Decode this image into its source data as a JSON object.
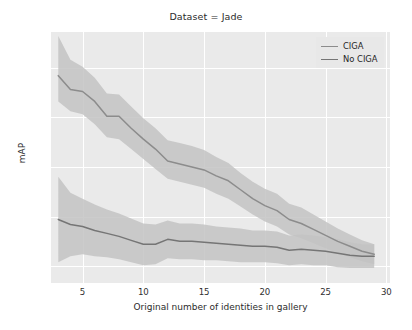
{
  "chart_data": {
    "type": "line",
    "title": "Dataset = Jade",
    "xlabel": "Original number of identities in gallery",
    "ylabel": "mAP",
    "xlim": [
      2.4,
      30.3
    ],
    "ylim": [
      0.383,
      0.636
    ],
    "xticks": [
      5,
      10,
      15,
      20,
      25,
      30
    ],
    "yticks": [
      0.4,
      0.45,
      0.5,
      0.55,
      0.6
    ],
    "ytick_labels": [
      "0.40",
      "0.45",
      "0.50",
      "0.55",
      "0.60"
    ],
    "xtick_labels": [
      "5",
      "10",
      "15",
      "20",
      "25",
      "30"
    ],
    "grid": true,
    "legend_position": "upper right",
    "band_type": "confidence interval",
    "x": [
      3,
      4,
      5,
      6,
      7,
      8,
      9,
      10,
      11,
      12,
      13,
      14,
      15,
      16,
      17,
      18,
      19,
      20,
      21,
      22,
      23,
      24,
      25,
      26,
      27,
      28,
      29
    ],
    "series": [
      {
        "name": "CIGA",
        "color": "#8c8c8c",
        "values": [
          0.592,
          0.578,
          0.576,
          0.566,
          0.551,
          0.551,
          0.539,
          0.528,
          0.518,
          0.506,
          0.503,
          0.5,
          0.497,
          0.491,
          0.486,
          0.477,
          0.468,
          0.461,
          0.456,
          0.447,
          0.443,
          0.437,
          0.431,
          0.425,
          0.42,
          0.415,
          0.412
        ],
        "band_lower": [
          0.566,
          0.556,
          0.553,
          0.543,
          0.53,
          0.528,
          0.518,
          0.508,
          0.498,
          0.488,
          0.485,
          0.482,
          0.479,
          0.473,
          0.468,
          0.46,
          0.452,
          0.445,
          0.44,
          0.432,
          0.428,
          0.423,
          0.418,
          0.413,
          0.409,
          0.405,
          0.402
        ],
        "band_upper": [
          0.632,
          0.608,
          0.601,
          0.59,
          0.574,
          0.573,
          0.561,
          0.549,
          0.539,
          0.527,
          0.524,
          0.521,
          0.517,
          0.51,
          0.504,
          0.494,
          0.485,
          0.478,
          0.473,
          0.463,
          0.459,
          0.452,
          0.445,
          0.438,
          0.432,
          0.426,
          0.422
        ]
      },
      {
        "name": "No CIGA",
        "color": "#757575",
        "values": [
          0.447,
          0.442,
          0.44,
          0.436,
          0.433,
          0.43,
          0.426,
          0.422,
          0.422,
          0.427,
          0.425,
          0.425,
          0.424,
          0.423,
          0.422,
          0.421,
          0.42,
          0.42,
          0.419,
          0.416,
          0.417,
          0.416,
          0.415,
          0.413,
          0.411,
          0.41,
          0.41
        ],
        "band_lower": [
          0.404,
          0.41,
          0.412,
          0.41,
          0.409,
          0.407,
          0.404,
          0.401,
          0.402,
          0.408,
          0.407,
          0.407,
          0.406,
          0.406,
          0.405,
          0.404,
          0.404,
          0.404,
          0.403,
          0.401,
          0.402,
          0.401,
          0.401,
          0.399,
          0.398,
          0.398,
          0.398
        ],
        "band_upper": [
          0.49,
          0.474,
          0.468,
          0.462,
          0.457,
          0.453,
          0.448,
          0.443,
          0.442,
          0.446,
          0.443,
          0.443,
          0.442,
          0.44,
          0.439,
          0.438,
          0.436,
          0.436,
          0.435,
          0.431,
          0.432,
          0.431,
          0.429,
          0.427,
          0.424,
          0.422,
          0.422
        ]
      }
    ]
  },
  "legend": {
    "items": [
      {
        "label": "CIGA"
      },
      {
        "label": "No CIGA"
      }
    ]
  },
  "colors": {
    "plot_background": "#eaeaea",
    "grid": "#ffffff",
    "band": "#c3c3c3",
    "text": "#2b2b2b"
  }
}
